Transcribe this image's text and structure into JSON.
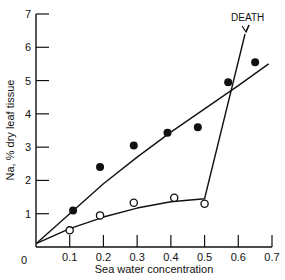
{
  "chart_data": {
    "type": "scatter",
    "title": "",
    "xlabel": "Sea water concentration",
    "ylabel": "Na, % dry leaf tissue",
    "xlim": [
      0,
      0.7
    ],
    "ylim": [
      0,
      7
    ],
    "grid": false,
    "legend": null,
    "x_ticks": [
      "0.1",
      "0.2",
      "0.3",
      "0.4",
      "0.5",
      "0.6",
      "0.7"
    ],
    "y_ticks": [
      "1",
      "2",
      "3",
      "4",
      "5",
      "6",
      "7"
    ],
    "origin_label": "0",
    "series": [
      {
        "name": "filled circles",
        "marker": "filled-circle",
        "points": [
          [
            0.11,
            1.1
          ],
          [
            0.19,
            2.4
          ],
          [
            0.29,
            3.05
          ],
          [
            0.39,
            3.43
          ],
          [
            0.48,
            3.6
          ],
          [
            0.57,
            4.95
          ],
          [
            0.65,
            5.55
          ]
        ],
        "fit_line": [
          [
            0.0,
            0.1
          ],
          [
            0.1,
            1.0
          ],
          [
            0.2,
            1.9
          ],
          [
            0.3,
            2.7
          ],
          [
            0.4,
            3.45
          ],
          [
            0.5,
            4.15
          ],
          [
            0.6,
            4.85
          ],
          [
            0.69,
            5.5
          ]
        ]
      },
      {
        "name": "open circles",
        "marker": "open-circle",
        "points": [
          [
            0.1,
            0.5
          ],
          [
            0.19,
            0.95
          ],
          [
            0.29,
            1.33
          ],
          [
            0.41,
            1.48
          ],
          [
            0.5,
            1.3
          ]
        ],
        "fit_line": [
          [
            0.0,
            0.1
          ],
          [
            0.1,
            0.55
          ],
          [
            0.2,
            0.9
          ],
          [
            0.3,
            1.17
          ],
          [
            0.4,
            1.36
          ],
          [
            0.5,
            1.45
          ],
          [
            0.62,
            6.4
          ]
        ]
      }
    ],
    "annotations": [
      {
        "text": "DEATH",
        "x": 0.61,
        "y": 6.9,
        "arrow_to": [
          0.62,
          6.4
        ]
      }
    ]
  }
}
